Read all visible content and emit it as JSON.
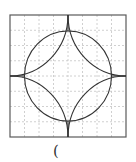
{
  "figure": {
    "grid": {
      "columns": 8,
      "rows": 8,
      "line_style": "dashed",
      "color": "#bdbdbd"
    },
    "outer_square": {
      "x": 10,
      "y": 15,
      "width": 116,
      "height": 122,
      "stroke": "#555555"
    },
    "center": {
      "x": 68,
      "y": 76
    },
    "circle": {
      "rx": 43.5,
      "ry": 45,
      "stroke": "#333333"
    },
    "arcs": {
      "description": "four quarter-arcs centered at the square's corners forming a four-pointed star",
      "stroke": "#333333"
    },
    "axes_lines": {
      "description": "horizontal and vertical center segments",
      "stroke": "#333333"
    }
  },
  "caption": {
    "text": "("
  }
}
